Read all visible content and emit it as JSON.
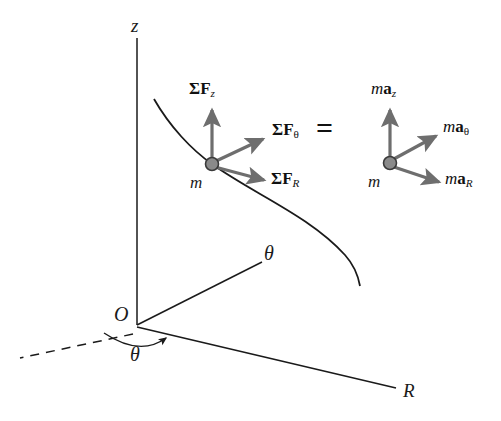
{
  "figure": {
    "type": "physics-free-body-diagram",
    "background_color": "#ffffff",
    "line_color": "#1a1a1a",
    "vector_color": "#6e6e6e",
    "particle_fill": "#8a8a8a",
    "particle_stroke": "#3a3a3a"
  },
  "axes": {
    "z": {
      "label": "z"
    },
    "theta": {
      "label": "θ"
    },
    "R": {
      "label": "R"
    },
    "origin": {
      "label": "O"
    }
  },
  "angle": {
    "label": "θ"
  },
  "free_body_diagram": {
    "particle_label": "m",
    "vectors": [
      {
        "name": "sum-F-z",
        "sigma": "Σ",
        "bold": "F",
        "sub": "z",
        "sub_italic": true
      },
      {
        "name": "sum-F-theta",
        "sigma": "Σ",
        "bold": "F",
        "sub": "θ",
        "sub_italic": false
      },
      {
        "name": "sum-F-R",
        "sigma": "Σ",
        "bold": "F",
        "sub": "R",
        "sub_italic": true
      }
    ]
  },
  "equals_sign": "=",
  "kinetic_diagram": {
    "particle_label": "m",
    "vectors": [
      {
        "name": "ma-z",
        "italic": "m",
        "bold": "a",
        "sub": "z",
        "sub_italic": true
      },
      {
        "name": "ma-theta",
        "italic": "m",
        "bold": "a",
        "sub": "θ",
        "sub_italic": false
      },
      {
        "name": "ma-R",
        "italic": "m",
        "bold": "a",
        "sub": "R",
        "sub_italic": true
      }
    ]
  }
}
